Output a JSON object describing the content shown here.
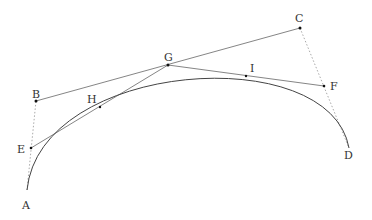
{
  "diagram": {
    "type": "bezier-construction",
    "colors": {
      "line": "#555555",
      "dotted": "#aaaaaa",
      "curve": "#444444",
      "point": "#111111"
    },
    "points": [
      {
        "id": "A",
        "label": "A",
        "x": 27,
        "y": 190,
        "lx": 22,
        "ly": 200
      },
      {
        "id": "B",
        "label": "B",
        "x": 36,
        "y": 101,
        "lx": 32,
        "ly": 89
      },
      {
        "id": "C",
        "label": "C",
        "x": 300,
        "y": 28,
        "lx": 295,
        "ly": 13
      },
      {
        "id": "D",
        "label": "D",
        "x": 349,
        "y": 148,
        "lx": 344,
        "ly": 150
      },
      {
        "id": "E",
        "label": "E",
        "x": 31,
        "y": 148,
        "lx": 17,
        "ly": 144
      },
      {
        "id": "F",
        "label": "F",
        "x": 324,
        "y": 86,
        "lx": 330,
        "ly": 81
      },
      {
        "id": "G",
        "label": "G",
        "x": 168,
        "y": 65,
        "lx": 164,
        "ly": 52
      },
      {
        "id": "H",
        "label": "H",
        "x": 100,
        "y": 107,
        "lx": 87,
        "ly": 94
      },
      {
        "id": "I",
        "label": "I",
        "x": 246,
        "y": 76,
        "lx": 250,
        "ly": 63
      }
    ]
  }
}
